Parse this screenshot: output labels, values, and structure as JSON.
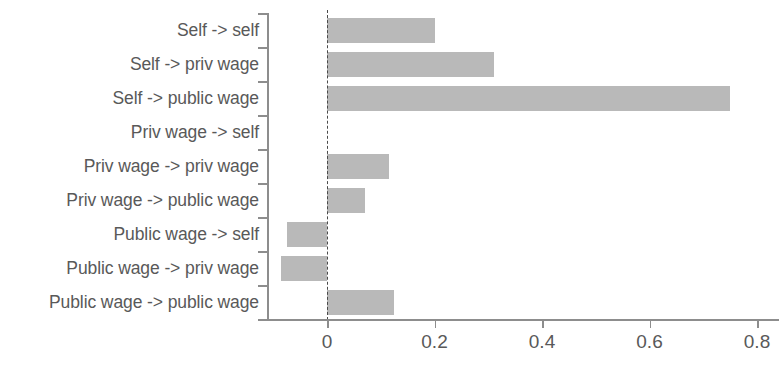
{
  "chart_data": {
    "type": "bar",
    "orientation": "horizontal",
    "title": "",
    "subtitle": "",
    "xlabel": "",
    "ylabel": "",
    "categories": [
      "Self -> self",
      "Self -> priv wage",
      "Self -> public wage",
      "Priv wage -> self",
      "Priv wage -> priv wage",
      "Priv wage -> public wage",
      "Public wage -> self",
      "Public wage -> priv wage",
      "Public wage -> public wage"
    ],
    "values": [
      0.2,
      0.31,
      0.75,
      0.0,
      0.115,
      0.07,
      -0.075,
      -0.085,
      0.125
    ],
    "xticks": [
      0,
      0.2,
      0.4,
      0.6,
      0.8
    ],
    "xticklabels": [
      "0",
      "0.2",
      "0.4",
      "0.6",
      "0.8"
    ],
    "xlim": [
      -0.113,
      0.85
    ],
    "grid": false,
    "legend": null,
    "reference_line": {
      "value": 0,
      "style": "dashed"
    },
    "bar_color": "#b9b9b9",
    "axis_color": "#8d8d8d",
    "text_color": "#595959",
    "background_color": "#ffffff"
  }
}
